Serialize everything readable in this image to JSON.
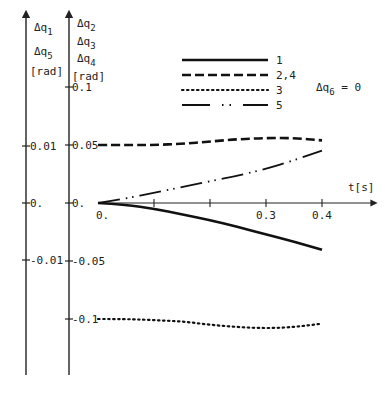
{
  "chart_data": {
    "type": "line",
    "title": "",
    "xlabel": "t[s]",
    "x_tick_labels": [
      "0.",
      "0.3",
      "0.4"
    ],
    "x_ticks": [
      0,
      0.1,
      0.2,
      0.3,
      0.4
    ],
    "xlim": [
      0,
      0.5
    ],
    "y_axes": [
      {
        "id": "left",
        "label_lines": [
          "Δq1",
          "Δq5",
          "[rad]"
        ],
        "tick_labels": [
          "0.01",
          "0.",
          "-0.01"
        ],
        "ticks": [
          0.01,
          0,
          -0.01
        ],
        "ylim": [
          -0.03,
          0.03
        ]
      },
      {
        "id": "right",
        "label_lines": [
          "Δq2",
          "Δq3",
          "Δq4",
          "[rad]"
        ],
        "tick_labels": [
          "0.1",
          "0.05",
          "0.",
          "-0.05",
          "-0.1"
        ],
        "ticks": [
          0.1,
          0.05,
          0,
          -0.05,
          -0.1
        ],
        "ylim": [
          -0.15,
          0.12
        ]
      }
    ],
    "legend": [
      {
        "key": "1",
        "style": "solid"
      },
      {
        "key": "2,4",
        "style": "dashed"
      },
      {
        "key": "3",
        "style": "dotted"
      },
      {
        "key": "5",
        "style": "dash-dot"
      }
    ],
    "annotation": "Δq6 = 0",
    "x": [
      0,
      0.05,
      0.1,
      0.15,
      0.2,
      0.25,
      0.3,
      0.35,
      0.4
    ],
    "series": [
      {
        "name": "1",
        "axis": "left",
        "style": "solid",
        "values": [
          0,
          -0.0003,
          -0.001,
          -0.002,
          -0.003,
          -0.0042,
          -0.0055,
          -0.0068,
          -0.0082
        ]
      },
      {
        "name": "2,4",
        "axis": "right",
        "style": "dashed",
        "values": [
          0.05,
          0.05,
          0.05,
          0.051,
          0.053,
          0.055,
          0.056,
          0.056,
          0.054
        ]
      },
      {
        "name": "3",
        "axis": "right",
        "style": "dotted",
        "values": [
          -0.1,
          -0.1,
          -0.101,
          -0.102,
          -0.105,
          -0.107,
          -0.108,
          -0.107,
          -0.104
        ]
      },
      {
        "name": "5",
        "axis": "left",
        "style": "dash-dot",
        "values": [
          0,
          0.0008,
          0.0018,
          0.0028,
          0.0038,
          0.0048,
          0.006,
          0.0075,
          0.0092
        ]
      }
    ]
  },
  "labels": {
    "left_axis": {
      "q1": "Δq",
      "q1_sub": "1",
      "q5": "Δq",
      "q5_sub": "5",
      "unit": "[rad]"
    },
    "right_axis": {
      "q2": "Δq",
      "q2_sub": "2",
      "q3": "Δq",
      "q3_sub": "3",
      "q4": "Δq",
      "q4_sub": "4",
      "unit": "[rad]"
    },
    "annotation_main": "Δq",
    "annotation_sub": "6",
    "annotation_eq": " = 0"
  }
}
